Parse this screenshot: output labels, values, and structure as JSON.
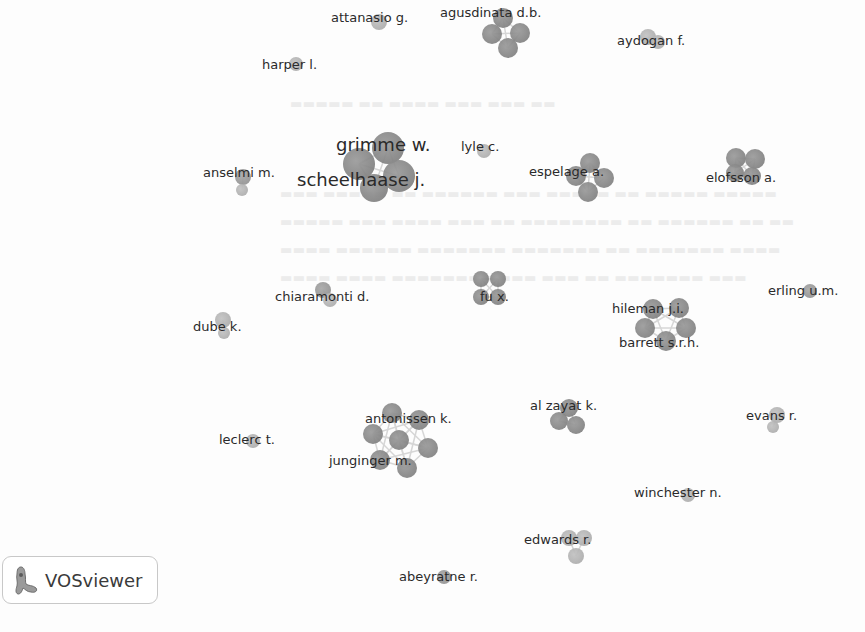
{
  "app": {
    "name": "VOSviewer",
    "logo_label": "VOSviewer"
  },
  "network": {
    "type": "co-authorship",
    "node_color": "#888888",
    "link_color": "#d6d6d6",
    "clusters": [
      {
        "id": "agusdinata",
        "labels": [
          {
            "text": "agusdinata d.b.",
            "x": 440,
            "y": 13,
            "size": "s"
          }
        ],
        "nodes": [
          {
            "x": 503,
            "y": 18,
            "r": 10
          },
          {
            "x": 492,
            "y": 34,
            "r": 10
          },
          {
            "x": 520,
            "y": 33,
            "r": 10
          },
          {
            "x": 508,
            "y": 48,
            "r": 10
          }
        ]
      },
      {
        "id": "attanasio",
        "labels": [
          {
            "text": "attanasio g.",
            "x": 331,
            "y": 18,
            "size": "s"
          }
        ],
        "nodes": [
          {
            "x": 379,
            "y": 22,
            "r": 8,
            "tone": "light"
          }
        ]
      },
      {
        "id": "aydogan",
        "labels": [
          {
            "text": "aydogan f.",
            "x": 617,
            "y": 41,
            "size": "s"
          }
        ],
        "nodes": [
          {
            "x": 648,
            "y": 37,
            "r": 8,
            "tone": "light"
          },
          {
            "x": 658,
            "y": 42,
            "r": 7,
            "tone": "light"
          }
        ]
      },
      {
        "id": "harper",
        "labels": [
          {
            "text": "harper l.",
            "x": 262,
            "y": 65,
            "size": "s"
          }
        ],
        "nodes": [
          {
            "x": 296,
            "y": 64,
            "r": 7,
            "tone": "light"
          }
        ]
      },
      {
        "id": "grimme",
        "labels": [
          {
            "text": "grimme w.",
            "x": 336,
            "y": 145,
            "size": "l"
          },
          {
            "text": "scheelhaase j.",
            "x": 297,
            "y": 180,
            "size": "l"
          }
        ],
        "nodes": [
          {
            "x": 388,
            "y": 148,
            "r": 16
          },
          {
            "x": 359,
            "y": 164,
            "r": 16
          },
          {
            "x": 399,
            "y": 176,
            "r": 16
          },
          {
            "x": 374,
            "y": 188,
            "r": 14
          }
        ]
      },
      {
        "id": "lyle",
        "labels": [
          {
            "text": "lyle c.",
            "x": 461,
            "y": 147,
            "size": "s"
          }
        ],
        "nodes": [
          {
            "x": 484,
            "y": 151,
            "r": 7,
            "tone": "light"
          }
        ]
      },
      {
        "id": "anselmi",
        "labels": [
          {
            "text": "anselmi m.",
            "x": 203,
            "y": 173,
            "size": "s"
          }
        ],
        "nodes": [
          {
            "x": 243,
            "y": 177,
            "r": 8,
            "tone": "mid"
          },
          {
            "x": 242,
            "y": 190,
            "r": 6,
            "tone": "light"
          }
        ]
      },
      {
        "id": "espelage",
        "labels": [
          {
            "text": "espelage a.",
            "x": 529,
            "y": 172,
            "size": "s"
          }
        ],
        "nodes": [
          {
            "x": 590,
            "y": 163,
            "r": 10
          },
          {
            "x": 576,
            "y": 176,
            "r": 10
          },
          {
            "x": 604,
            "y": 178,
            "r": 10
          },
          {
            "x": 588,
            "y": 192,
            "r": 10
          }
        ]
      },
      {
        "id": "elofsson",
        "labels": [
          {
            "text": "elofsson a.",
            "x": 706,
            "y": 178,
            "size": "s"
          }
        ],
        "nodes": [
          {
            "x": 736,
            "y": 158,
            "r": 10
          },
          {
            "x": 755,
            "y": 159,
            "r": 10
          },
          {
            "x": 735,
            "y": 173,
            "r": 9
          },
          {
            "x": 752,
            "y": 176,
            "r": 9
          }
        ]
      },
      {
        "id": "chiaramonti",
        "labels": [
          {
            "text": "chiaramonti d.",
            "x": 275,
            "y": 297,
            "size": "s"
          }
        ],
        "nodes": [
          {
            "x": 323,
            "y": 290,
            "r": 8,
            "tone": "mid"
          },
          {
            "x": 330,
            "y": 300,
            "r": 7,
            "tone": "light"
          }
        ]
      },
      {
        "id": "fu",
        "labels": [
          {
            "text": "fu x.",
            "x": 480,
            "y": 297,
            "size": "s"
          }
        ],
        "nodes": [
          {
            "x": 481,
            "y": 279,
            "r": 8
          },
          {
            "x": 498,
            "y": 279,
            "r": 8
          },
          {
            "x": 481,
            "y": 297,
            "r": 8
          },
          {
            "x": 498,
            "y": 297,
            "r": 8
          }
        ]
      },
      {
        "id": "erling",
        "labels": [
          {
            "text": "erling u.m.",
            "x": 768,
            "y": 291,
            "size": "s"
          }
        ],
        "nodes": [
          {
            "x": 810,
            "y": 291,
            "r": 7,
            "tone": "mid"
          }
        ]
      },
      {
        "id": "dube",
        "labels": [
          {
            "text": "dube k.",
            "x": 193,
            "y": 327,
            "size": "s"
          }
        ],
        "nodes": [
          {
            "x": 223,
            "y": 320,
            "r": 8,
            "tone": "light"
          },
          {
            "x": 224,
            "y": 333,
            "r": 6,
            "tone": "light"
          }
        ]
      },
      {
        "id": "hileman",
        "labels": [
          {
            "text": "hileman j.i.",
            "x": 612,
            "y": 309,
            "size": "s"
          },
          {
            "text": "barrett s.r.h.",
            "x": 619,
            "y": 343,
            "size": "s"
          }
        ],
        "nodes": [
          {
            "x": 653,
            "y": 309,
            "r": 10
          },
          {
            "x": 679,
            "y": 308,
            "r": 10
          },
          {
            "x": 645,
            "y": 328,
            "r": 10
          },
          {
            "x": 686,
            "y": 328,
            "r": 10
          },
          {
            "x": 666,
            "y": 341,
            "r": 10
          }
        ]
      },
      {
        "id": "alzayat",
        "labels": [
          {
            "text": "al zayat k.",
            "x": 530,
            "y": 406,
            "size": "s"
          }
        ],
        "nodes": [
          {
            "x": 569,
            "y": 408,
            "r": 9
          },
          {
            "x": 559,
            "y": 421,
            "r": 9
          },
          {
            "x": 576,
            "y": 425,
            "r": 9
          }
        ]
      },
      {
        "id": "antonissen",
        "labels": [
          {
            "text": "antonissen k.",
            "x": 365,
            "y": 419,
            "size": "s"
          },
          {
            "text": "junginger m.",
            "x": 329,
            "y": 461,
            "size": "s"
          }
        ],
        "nodes": [
          {
            "x": 392,
            "y": 413,
            "r": 10
          },
          {
            "x": 419,
            "y": 420,
            "r": 10
          },
          {
            "x": 373,
            "y": 434,
            "r": 10
          },
          {
            "x": 399,
            "y": 440,
            "r": 10
          },
          {
            "x": 428,
            "y": 448,
            "r": 10
          },
          {
            "x": 380,
            "y": 460,
            "r": 10
          },
          {
            "x": 407,
            "y": 468,
            "r": 10
          }
        ]
      },
      {
        "id": "evans",
        "labels": [
          {
            "text": "evans r.",
            "x": 746,
            "y": 416,
            "size": "s"
          }
        ],
        "nodes": [
          {
            "x": 777,
            "y": 415,
            "r": 8,
            "tone": "light"
          },
          {
            "x": 773,
            "y": 427,
            "r": 6,
            "tone": "light"
          }
        ]
      },
      {
        "id": "leclerc",
        "labels": [
          {
            "text": "leclerc t.",
            "x": 219,
            "y": 440,
            "size": "s"
          }
        ],
        "nodes": [
          {
            "x": 253,
            "y": 441,
            "r": 7,
            "tone": "light"
          }
        ]
      },
      {
        "id": "winchester",
        "labels": [
          {
            "text": "winchester n.",
            "x": 634,
            "y": 493,
            "size": "s"
          }
        ],
        "nodes": [
          {
            "x": 688,
            "y": 495,
            "r": 7,
            "tone": "light"
          }
        ]
      },
      {
        "id": "edwards",
        "labels": [
          {
            "text": "edwards r.",
            "x": 524,
            "y": 540,
            "size": "s"
          }
        ],
        "nodes": [
          {
            "x": 569,
            "y": 538,
            "r": 8,
            "tone": "light"
          },
          {
            "x": 584,
            "y": 538,
            "r": 8,
            "tone": "light"
          },
          {
            "x": 576,
            "y": 556,
            "r": 8,
            "tone": "light"
          }
        ]
      },
      {
        "id": "abeyratne",
        "labels": [
          {
            "text": "abeyratne r.",
            "x": 399,
            "y": 577,
            "size": "s"
          }
        ],
        "nodes": [
          {
            "x": 444,
            "y": 577,
            "r": 7,
            "tone": "mid"
          }
        ]
      }
    ]
  }
}
